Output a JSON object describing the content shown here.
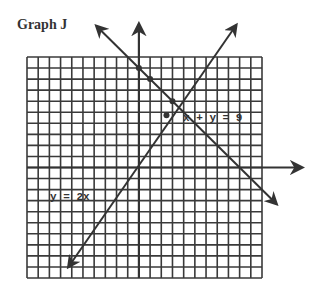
{
  "title": "Graph J",
  "chart_data": {
    "type": "line",
    "title": "Graph J",
    "xlabel": "",
    "ylabel": "",
    "grid": true,
    "xlim": [
      -10,
      11
    ],
    "ylim": [
      -10,
      10
    ],
    "series": [
      {
        "name": "x + y = 9",
        "label": "x + y = 9",
        "equation": "x + y = 9",
        "marked_points": [
          [
            0,
            9
          ],
          [
            1,
            8
          ],
          [
            3,
            6
          ]
        ]
      },
      {
        "name": "y = 2x",
        "label": "y = 2x",
        "equation": "y = 2x",
        "marked_points": [
          [
            3,
            6
          ]
        ]
      }
    ],
    "intersection": [
      3,
      6
    ]
  }
}
